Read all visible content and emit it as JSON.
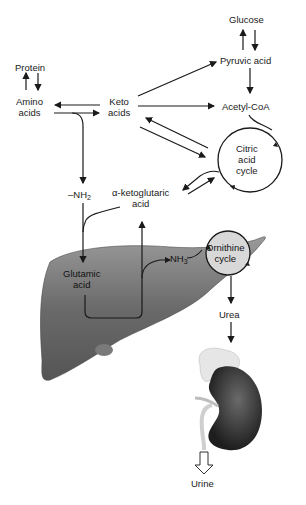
{
  "diagram": {
    "nodes": {
      "glucose": "Glucose",
      "pyruvic_acid": "Pyruvic acid",
      "acetyl_coa": "Acetyl-CoA",
      "protein": "Protein",
      "amino_acids_1": "Amino",
      "amino_acids_2": "acids",
      "keto_acids_1": "Keto",
      "keto_acids_2": "acids",
      "citric_1": "Citric",
      "citric_2": "acid",
      "citric_3": "cycle",
      "nh2_prefix": "–NH",
      "nh2_sub": "2",
      "akg_1": "α-ketoglutaric",
      "akg_2": "acid",
      "glutamic_1": "Glutamic",
      "glutamic_2": "acid",
      "nh3_prefix": "NH",
      "nh3_sub": "3",
      "ornithine_1": "Ornithine",
      "ornithine_2": "cycle",
      "urea": "Urea",
      "urine": "Urine"
    },
    "organs": [
      "liver",
      "kidney",
      "adrenal-gland"
    ],
    "colors": {
      "line": "#1a1a1a",
      "liver": "#6e6e6e",
      "kidney": "#3a3a3a",
      "ornithine_fill": "#d8d8d8",
      "adrenal": "#e6e6e6"
    }
  }
}
